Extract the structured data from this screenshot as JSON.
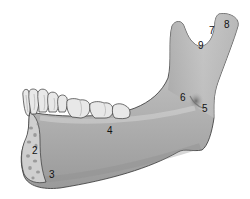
{
  "figure": {
    "colors": {
      "background": "#ffffff",
      "bone_fill": "#b8b8b8",
      "bone_light": "#d4d4d4",
      "bone_shadow": "#8c8c8c",
      "outline": "#333333",
      "tooth_fill": "#e8e8e8",
      "cut_surface": "#c9c9c9",
      "trabecular_spots": "#8a8a8a",
      "label_color": "#111111"
    },
    "labels": [
      {
        "id": "2",
        "text": "2",
        "x": 32,
        "y": 154
      },
      {
        "id": "3",
        "text": "3",
        "x": 49,
        "y": 178
      },
      {
        "id": "4",
        "text": "4",
        "x": 107,
        "y": 134
      },
      {
        "id": "5",
        "text": "5",
        "x": 202,
        "y": 112
      },
      {
        "id": "6",
        "text": "6",
        "x": 180,
        "y": 101
      },
      {
        "id": "7",
        "text": "7",
        "x": 209,
        "y": 34
      },
      {
        "id": "8",
        "text": "8",
        "x": 224,
        "y": 28
      },
      {
        "id": "9",
        "text": "9",
        "x": 198,
        "y": 49
      }
    ]
  }
}
